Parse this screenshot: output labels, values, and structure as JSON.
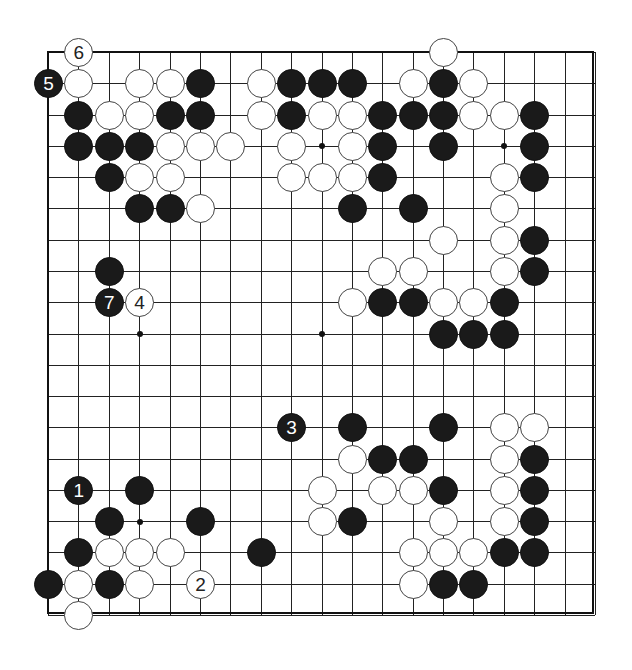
{
  "board": {
    "size": 19,
    "origin": {
      "x": 48,
      "y": 52
    },
    "spacing": {
      "x": 30.39,
      "y": 31.28
    },
    "colors": {
      "black": "#1a1a1a",
      "white": "#ffffff",
      "line": "#222222"
    },
    "star_points": [
      [
        3,
        9
      ],
      [
        9,
        3
      ],
      [
        15,
        3
      ],
      [
        9,
        9
      ],
      [
        3,
        15
      ]
    ],
    "stones": [
      {
        "color": "white",
        "col": 1,
        "row": 0,
        "label": "6"
      },
      {
        "color": "white",
        "col": 13,
        "row": 0,
        "label": ""
      },
      {
        "color": "black",
        "col": 0,
        "row": 1,
        "label": "5"
      },
      {
        "color": "white",
        "col": 1,
        "row": 1,
        "label": ""
      },
      {
        "color": "white",
        "col": 3,
        "row": 1,
        "label": ""
      },
      {
        "color": "white",
        "col": 4,
        "row": 1,
        "label": ""
      },
      {
        "color": "black",
        "col": 5,
        "row": 1,
        "label": ""
      },
      {
        "color": "white",
        "col": 7,
        "row": 1,
        "label": ""
      },
      {
        "color": "black",
        "col": 8,
        "row": 1,
        "label": ""
      },
      {
        "color": "black",
        "col": 9,
        "row": 1,
        "label": ""
      },
      {
        "color": "black",
        "col": 10,
        "row": 1,
        "label": ""
      },
      {
        "color": "white",
        "col": 12,
        "row": 1,
        "label": ""
      },
      {
        "color": "black",
        "col": 13,
        "row": 1,
        "label": ""
      },
      {
        "color": "white",
        "col": 14,
        "row": 1,
        "label": ""
      },
      {
        "color": "black",
        "col": 1,
        "row": 2,
        "label": ""
      },
      {
        "color": "white",
        "col": 2,
        "row": 2,
        "label": ""
      },
      {
        "color": "white",
        "col": 3,
        "row": 2,
        "label": ""
      },
      {
        "color": "black",
        "col": 4,
        "row": 2,
        "label": ""
      },
      {
        "color": "black",
        "col": 5,
        "row": 2,
        "label": ""
      },
      {
        "color": "white",
        "col": 7,
        "row": 2,
        "label": ""
      },
      {
        "color": "black",
        "col": 8,
        "row": 2,
        "label": ""
      },
      {
        "color": "white",
        "col": 9,
        "row": 2,
        "label": ""
      },
      {
        "color": "white",
        "col": 10,
        "row": 2,
        "label": ""
      },
      {
        "color": "black",
        "col": 11,
        "row": 2,
        "label": ""
      },
      {
        "color": "black",
        "col": 12,
        "row": 2,
        "label": ""
      },
      {
        "color": "black",
        "col": 13,
        "row": 2,
        "label": ""
      },
      {
        "color": "white",
        "col": 14,
        "row": 2,
        "label": ""
      },
      {
        "color": "white",
        "col": 15,
        "row": 2,
        "label": ""
      },
      {
        "color": "black",
        "col": 16,
        "row": 2,
        "label": ""
      },
      {
        "color": "black",
        "col": 1,
        "row": 3,
        "label": ""
      },
      {
        "color": "black",
        "col": 2,
        "row": 3,
        "label": ""
      },
      {
        "color": "black",
        "col": 3,
        "row": 3,
        "label": ""
      },
      {
        "color": "white",
        "col": 4,
        "row": 3,
        "label": ""
      },
      {
        "color": "white",
        "col": 5,
        "row": 3,
        "label": ""
      },
      {
        "color": "white",
        "col": 6,
        "row": 3,
        "label": ""
      },
      {
        "color": "white",
        "col": 8,
        "row": 3,
        "label": ""
      },
      {
        "color": "white",
        "col": 10,
        "row": 3,
        "label": ""
      },
      {
        "color": "black",
        "col": 11,
        "row": 3,
        "label": ""
      },
      {
        "color": "black",
        "col": 13,
        "row": 3,
        "label": ""
      },
      {
        "color": "black",
        "col": 16,
        "row": 3,
        "label": ""
      },
      {
        "color": "black",
        "col": 2,
        "row": 4,
        "label": ""
      },
      {
        "color": "white",
        "col": 3,
        "row": 4,
        "label": ""
      },
      {
        "color": "white",
        "col": 4,
        "row": 4,
        "label": ""
      },
      {
        "color": "white",
        "col": 8,
        "row": 4,
        "label": ""
      },
      {
        "color": "white",
        "col": 9,
        "row": 4,
        "label": ""
      },
      {
        "color": "white",
        "col": 10,
        "row": 4,
        "label": ""
      },
      {
        "color": "black",
        "col": 11,
        "row": 4,
        "label": ""
      },
      {
        "color": "white",
        "col": 15,
        "row": 4,
        "label": ""
      },
      {
        "color": "black",
        "col": 16,
        "row": 4,
        "label": ""
      },
      {
        "color": "black",
        "col": 3,
        "row": 5,
        "label": ""
      },
      {
        "color": "black",
        "col": 4,
        "row": 5,
        "label": ""
      },
      {
        "color": "white",
        "col": 5,
        "row": 5,
        "label": ""
      },
      {
        "color": "black",
        "col": 10,
        "row": 5,
        "label": ""
      },
      {
        "color": "black",
        "col": 12,
        "row": 5,
        "label": ""
      },
      {
        "color": "white",
        "col": 15,
        "row": 5,
        "label": ""
      },
      {
        "color": "white",
        "col": 13,
        "row": 6,
        "label": ""
      },
      {
        "color": "white",
        "col": 15,
        "row": 6,
        "label": ""
      },
      {
        "color": "black",
        "col": 16,
        "row": 6,
        "label": ""
      },
      {
        "color": "black",
        "col": 2,
        "row": 7,
        "label": ""
      },
      {
        "color": "white",
        "col": 11,
        "row": 7,
        "label": ""
      },
      {
        "color": "white",
        "col": 12,
        "row": 7,
        "label": ""
      },
      {
        "color": "white",
        "col": 15,
        "row": 7,
        "label": ""
      },
      {
        "color": "black",
        "col": 16,
        "row": 7,
        "label": ""
      },
      {
        "color": "black",
        "col": 2,
        "row": 8,
        "label": "7"
      },
      {
        "color": "white",
        "col": 3,
        "row": 8,
        "label": "4"
      },
      {
        "color": "white",
        "col": 10,
        "row": 8,
        "label": ""
      },
      {
        "color": "black",
        "col": 11,
        "row": 8,
        "label": ""
      },
      {
        "color": "black",
        "col": 12,
        "row": 8,
        "label": ""
      },
      {
        "color": "white",
        "col": 13,
        "row": 8,
        "label": ""
      },
      {
        "color": "white",
        "col": 14,
        "row": 8,
        "label": ""
      },
      {
        "color": "black",
        "col": 15,
        "row": 8,
        "label": ""
      },
      {
        "color": "black",
        "col": 13,
        "row": 9,
        "label": ""
      },
      {
        "color": "black",
        "col": 14,
        "row": 9,
        "label": ""
      },
      {
        "color": "black",
        "col": 15,
        "row": 9,
        "label": ""
      },
      {
        "color": "black",
        "col": 8,
        "row": 12,
        "label": "3"
      },
      {
        "color": "black",
        "col": 10,
        "row": 12,
        "label": ""
      },
      {
        "color": "black",
        "col": 13,
        "row": 12,
        "label": ""
      },
      {
        "color": "white",
        "col": 15,
        "row": 12,
        "label": ""
      },
      {
        "color": "white",
        "col": 16,
        "row": 12,
        "label": ""
      },
      {
        "color": "white",
        "col": 10,
        "row": 13,
        "label": ""
      },
      {
        "color": "black",
        "col": 11,
        "row": 13,
        "label": ""
      },
      {
        "color": "black",
        "col": 12,
        "row": 13,
        "label": ""
      },
      {
        "color": "white",
        "col": 15,
        "row": 13,
        "label": ""
      },
      {
        "color": "black",
        "col": 16,
        "row": 13,
        "label": ""
      },
      {
        "color": "black",
        "col": 1,
        "row": 14,
        "label": "1"
      },
      {
        "color": "black",
        "col": 3,
        "row": 14,
        "label": ""
      },
      {
        "color": "white",
        "col": 9,
        "row": 14,
        "label": ""
      },
      {
        "color": "white",
        "col": 11,
        "row": 14,
        "label": ""
      },
      {
        "color": "white",
        "col": 12,
        "row": 14,
        "label": ""
      },
      {
        "color": "black",
        "col": 13,
        "row": 14,
        "label": ""
      },
      {
        "color": "white",
        "col": 15,
        "row": 14,
        "label": ""
      },
      {
        "color": "black",
        "col": 16,
        "row": 14,
        "label": ""
      },
      {
        "color": "black",
        "col": 2,
        "row": 15,
        "label": ""
      },
      {
        "color": "black",
        "col": 5,
        "row": 15,
        "label": ""
      },
      {
        "color": "white",
        "col": 9,
        "row": 15,
        "label": ""
      },
      {
        "color": "black",
        "col": 10,
        "row": 15,
        "label": ""
      },
      {
        "color": "white",
        "col": 13,
        "row": 15,
        "label": ""
      },
      {
        "color": "white",
        "col": 15,
        "row": 15,
        "label": ""
      },
      {
        "color": "black",
        "col": 16,
        "row": 15,
        "label": ""
      },
      {
        "color": "black",
        "col": 1,
        "row": 16,
        "label": ""
      },
      {
        "color": "white",
        "col": 2,
        "row": 16,
        "label": ""
      },
      {
        "color": "white",
        "col": 3,
        "row": 16,
        "label": ""
      },
      {
        "color": "white",
        "col": 4,
        "row": 16,
        "label": ""
      },
      {
        "color": "black",
        "col": 7,
        "row": 16,
        "label": ""
      },
      {
        "color": "white",
        "col": 12,
        "row": 16,
        "label": ""
      },
      {
        "color": "white",
        "col": 13,
        "row": 16,
        "label": ""
      },
      {
        "color": "white",
        "col": 14,
        "row": 16,
        "label": ""
      },
      {
        "color": "black",
        "col": 15,
        "row": 16,
        "label": ""
      },
      {
        "color": "black",
        "col": 16,
        "row": 16,
        "label": ""
      },
      {
        "color": "black",
        "col": 0,
        "row": 17,
        "label": ""
      },
      {
        "color": "white",
        "col": 1,
        "row": 17,
        "label": ""
      },
      {
        "color": "black",
        "col": 2,
        "row": 17,
        "label": ""
      },
      {
        "color": "white",
        "col": 3,
        "row": 17,
        "label": ""
      },
      {
        "color": "white",
        "col": 5,
        "row": 17,
        "label": "2"
      },
      {
        "color": "white",
        "col": 12,
        "row": 17,
        "label": ""
      },
      {
        "color": "black",
        "col": 13,
        "row": 17,
        "label": ""
      },
      {
        "color": "black",
        "col": 14,
        "row": 17,
        "label": ""
      },
      {
        "color": "white",
        "col": 1,
        "row": 18,
        "label": ""
      }
    ]
  }
}
